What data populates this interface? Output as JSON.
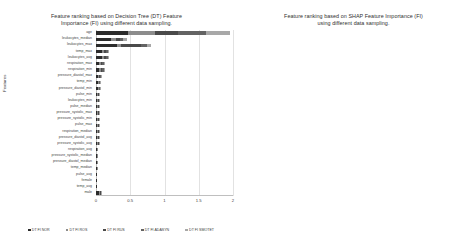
{
  "left_panel": {
    "title": "Feature ranking based on Decision Tree (DT) Feature\nImportance (FI) using different data sampling.",
    "ylabel": "Features"
  },
  "right_panel": {
    "title": "Feature ranking based on SHAP Feature Importance (FI)\nusing different data sampling.",
    "ylabel": "Features"
  },
  "colors": {
    "series_1": "#2b2b2b",
    "series_2": "#8c8c8c",
    "series_3": "#4a4a4a",
    "series_4": "#636363",
    "series_5": "#a8a8a8",
    "gridline": "#e2e2e2",
    "axis": "#bfbfbf"
  },
  "chart_data": [
    {
      "type": "bar",
      "orientation": "horizontal",
      "stacked": true,
      "title": "Feature ranking based on Decision Tree (DT) Feature Importance (FI) using different data sampling.",
      "xlabel": "",
      "ylabel": "Features",
      "xlim": [
        0,
        2
      ],
      "xticks": [
        "0",
        "0.5",
        "1",
        "1.5",
        "2"
      ],
      "grid": true,
      "legend_position": "bottom",
      "categories": [
        "age",
        "leukocytes_median",
        "leukocytes_max",
        "temp_max",
        "leukocytes_avg",
        "respiration_max",
        "respiration_min",
        "pressure_diastol_max",
        "temp_min",
        "pressure_diastol_min",
        "pulse_min",
        "leukocytes_min",
        "pulse_median",
        "pressure_systolic_max",
        "pressure_systolic_min",
        "pulse_max",
        "respiration_median",
        "pressure_diastol_avg",
        "pressure_systolic_avg",
        "respiration_avg",
        "pressure_systolic_median",
        "pressure_diastol_median",
        "temp_median",
        "pulse_avg",
        "female",
        "temp_avg",
        "male"
      ],
      "series": [
        {
          "name": "DT FI NOR",
          "values": [
            0.46,
            0.22,
            0.3,
            0.09,
            0.09,
            0.05,
            0.05,
            0.03,
            0.03,
            0.03,
            0.02,
            0.02,
            0.02,
            0.02,
            0.02,
            0.02,
            0.02,
            0.02,
            0.02,
            0.01,
            0.01,
            0.01,
            0.01,
            0.01,
            0.01,
            0.01,
            0.05
          ]
        },
        {
          "name": "DT FI ROS",
          "values": [
            0.4,
            0.07,
            0.06,
            0.03,
            0.03,
            0.02,
            0.02,
            0.02,
            0.01,
            0.01,
            0.01,
            0.01,
            0.01,
            0.01,
            0.01,
            0.01,
            0.01,
            0.01,
            0.01,
            0.01,
            0.01,
            0.01,
            0.01,
            0.0,
            0.0,
            0.0,
            0.01
          ]
        },
        {
          "name": "DT FI RUS",
          "values": [
            0.34,
            0.06,
            0.3,
            0.03,
            0.03,
            0.02,
            0.02,
            0.01,
            0.01,
            0.01,
            0.01,
            0.01,
            0.01,
            0.01,
            0.01,
            0.01,
            0.01,
            0.01,
            0.01,
            0.0,
            0.0,
            0.0,
            0.0,
            0.0,
            0.0,
            0.0,
            0.01
          ]
        },
        {
          "name": "DT FI ADASYN",
          "values": [
            0.4,
            0.05,
            0.08,
            0.02,
            0.02,
            0.02,
            0.02,
            0.01,
            0.01,
            0.01,
            0.01,
            0.01,
            0.01,
            0.01,
            0.01,
            0.01,
            0.01,
            0.01,
            0.01,
            0.0,
            0.0,
            0.0,
            0.0,
            0.0,
            0.0,
            0.0,
            0.01
          ]
        },
        {
          "name": "DT FI SMOTET",
          "values": [
            0.36,
            0.05,
            0.06,
            0.02,
            0.02,
            0.02,
            0.01,
            0.01,
            0.01,
            0.01,
            0.01,
            0.01,
            0.01,
            0.01,
            0.01,
            0.01,
            0.01,
            0.01,
            0.01,
            0.0,
            0.0,
            0.0,
            0.0,
            0.0,
            0.0,
            0.0,
            0.01
          ]
        }
      ]
    },
    {
      "type": "bar",
      "orientation": "horizontal",
      "stacked": true,
      "title": "Feature ranking based on SHAP Feature Importance (FI) using different data sampling.",
      "xlabel": "",
      "ylabel": "Features",
      "xlim": [
        0,
        1.2
      ],
      "xticks": [
        "0",
        "0.2",
        "0.4",
        "0.6",
        "0.8",
        "1",
        "1.2"
      ],
      "grid": true,
      "legend_position": "bottom",
      "categories": [
        "age",
        "leukocytes_median",
        "leukocytes_max",
        "temp_max",
        "leukocytes_avg",
        "respiration_max",
        "respiration_min",
        "pressure_diastol_max",
        "temp_min",
        "pressure_diastol_min",
        "pulse_min",
        "leukocytes_min",
        "pulse_median",
        "pressure_systolic_max",
        "pressure_systolic_min",
        "pulse_max",
        "respiration_median",
        "pressure_diastol_avg",
        "pressure_systolic_avg",
        "respiration_avg",
        "pressure_systolic_median",
        "pressure_diastol_median",
        "temp_median",
        "pulse_avg",
        "female",
        "temp_avg",
        "male"
      ],
      "series": [
        {
          "name": "SHAP FI NORMAL",
          "values": [
            0.3,
            0.14,
            0.16,
            0.06,
            0.08,
            0.04,
            0.03,
            0.02,
            0.02,
            0.02,
            0.02,
            0.02,
            0.02,
            0.01,
            0.01,
            0.01,
            0.01,
            0.01,
            0.01,
            0.01,
            0.01,
            0.01,
            0.01,
            0.01,
            0.01,
            0.01,
            0.03
          ]
        },
        {
          "name": "SHAP FI ROS",
          "values": [
            0.24,
            0.05,
            0.04,
            0.02,
            0.02,
            0.02,
            0.01,
            0.01,
            0.01,
            0.01,
            0.01,
            0.01,
            0.01,
            0.01,
            0.01,
            0.01,
            0.01,
            0.01,
            0.01,
            0.0,
            0.0,
            0.0,
            0.0,
            0.0,
            0.0,
            0.0,
            0.01
          ]
        },
        {
          "name": "SHAP FI RUS",
          "values": [
            0.22,
            0.04,
            0.16,
            0.02,
            0.02,
            0.01,
            0.01,
            0.01,
            0.01,
            0.01,
            0.01,
            0.01,
            0.01,
            0.01,
            0.01,
            0.01,
            0.01,
            0.0,
            0.0,
            0.0,
            0.0,
            0.0,
            0.0,
            0.0,
            0.0,
            0.0,
            0.01
          ]
        },
        {
          "name": "SHAP FI ADASYN",
          "values": [
            0.26,
            0.04,
            0.05,
            0.02,
            0.02,
            0.01,
            0.01,
            0.01,
            0.01,
            0.01,
            0.01,
            0.01,
            0.01,
            0.01,
            0.01,
            0.01,
            0.0,
            0.0,
            0.0,
            0.0,
            0.0,
            0.0,
            0.0,
            0.0,
            0.0,
            0.0,
            0.01
          ]
        },
        {
          "name": "SHAP FI SMOTET",
          "values": [
            0.22,
            0.04,
            0.04,
            0.02,
            0.02,
            0.01,
            0.01,
            0.01,
            0.01,
            0.01,
            0.01,
            0.01,
            0.01,
            0.01,
            0.01,
            0.0,
            0.0,
            0.0,
            0.0,
            0.0,
            0.0,
            0.0,
            0.0,
            0.0,
            0.0,
            0.0,
            0.01
          ]
        }
      ]
    }
  ]
}
